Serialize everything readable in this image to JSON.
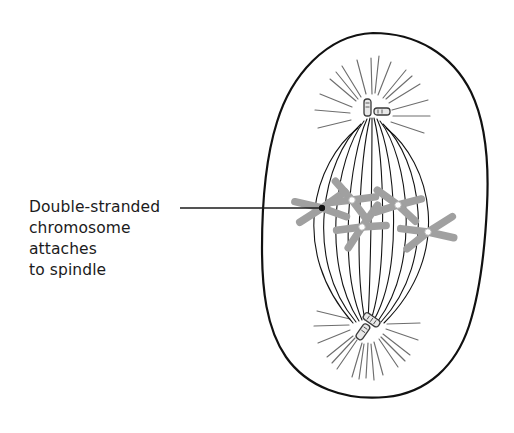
{
  "figure": {
    "name": "mitosis-metaphase-cell-diagram",
    "background_color": "#ffffff"
  },
  "callout": {
    "lines": [
      "Double-stranded",
      "chromosome",
      "attaches",
      "to spindle"
    ],
    "text_color": "#1b1b1b",
    "leader_line": {
      "color": "#1b1b1b",
      "start_x": 180,
      "start_y": 208,
      "end_x": 322,
      "end_y": 208,
      "dot_radius": 3.2
    }
  },
  "cell": {
    "outline_color": "#111111",
    "outline_width": 2.2,
    "fill_color": "#ffffff",
    "center_x": 375,
    "center_y": 214,
    "radius_x": 113,
    "radius_y": 182
  },
  "spindle": {
    "fiber_color": "#141414",
    "fiber_width": 1.1,
    "fiber_count": 11,
    "top_pole_x": 372,
    "top_pole_y": 112,
    "bottom_pole_x": 368,
    "bottom_pole_y": 325,
    "max_bulge": 62
  },
  "asters": {
    "ray_color": "#6e6e6e",
    "top_ray_count": 16,
    "bottom_ray_count": 16,
    "top_inner_radius": 16,
    "top_outer_radius": 52,
    "bottom_inner_radius": 14,
    "bottom_outer_radius": 48
  },
  "centrioles": {
    "outline_color": "#3a3a3a",
    "fill_color": "#e8e8e8",
    "top": {
      "x": 372,
      "y": 110
    },
    "bottom": {
      "x": 368,
      "y": 325
    }
  },
  "chromosomes": {
    "color": "#a0a0a0",
    "centromere_color": "#ffffff",
    "arm_width": 7.5,
    "count": 5,
    "items": [
      {
        "label": "chromosome-left",
        "cx": 322,
        "cy": 208,
        "rotate": -8
      },
      {
        "label": "chromosome-upper-mid",
        "cx": 352,
        "cy": 200,
        "rotate": 20
      },
      {
        "label": "chromosome-center",
        "cx": 362,
        "cy": 227,
        "rotate": -28
      },
      {
        "label": "chromosome-upper-right",
        "cx": 398,
        "cy": 205,
        "rotate": 10
      },
      {
        "label": "chromosome-lower-right",
        "cx": 428,
        "cy": 232,
        "rotate": -12
      }
    ]
  }
}
